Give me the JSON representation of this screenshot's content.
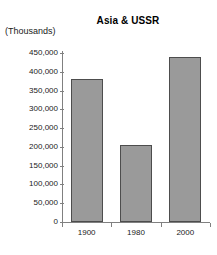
{
  "chart_data": {
    "type": "bar",
    "title": "Asia & USSR",
    "xlabel": "",
    "ylabel": "(Thousands)",
    "categories": [
      "1900",
      "1980",
      "2000"
    ],
    "values": [
      380000,
      205000,
      440000
    ],
    "ylim": [
      0,
      450000
    ],
    "ytick_labels": [
      "450,000",
      "400,000",
      "350,000",
      "300,000",
      "250,000",
      "200,000",
      "150,000",
      "100,000",
      "50,000",
      "0"
    ],
    "ytick_values": [
      450000,
      400000,
      350000,
      300000,
      250000,
      200000,
      150000,
      100000,
      50000,
      0
    ],
    "grid": false,
    "legend": null,
    "series": [
      {
        "name": "Asia & USSR",
        "values": [
          380000,
          205000,
          440000
        ],
        "color": "#9a9a9a",
        "border_color": "#4d4d4d"
      }
    ]
  },
  "colors": {
    "bar_fill": "#9a9a9a",
    "bar_border": "#4d4d4d",
    "axis": "#808080",
    "text": "#1a1a1a",
    "background": "#ffffff"
  }
}
